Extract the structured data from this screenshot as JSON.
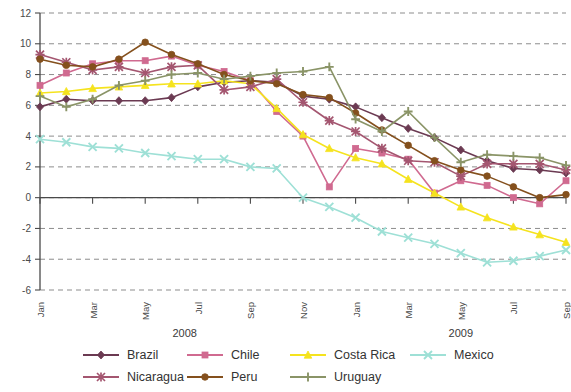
{
  "chart_data": {
    "type": "line",
    "title": "",
    "subtitle": "",
    "xlabel": "",
    "ylabel": "",
    "ylim": [
      -6,
      12
    ],
    "yticks": [
      -6,
      -4,
      -2,
      0,
      2,
      4,
      6,
      8,
      10,
      12
    ],
    "grid": true,
    "legend_position": "bottom",
    "x": [
      "Jan",
      "Feb",
      "Mar",
      "Apr",
      "May",
      "Jun",
      "Jul",
      "Aug",
      "Sep",
      "Oct",
      "Nov",
      "Dec",
      "Jan",
      "Feb",
      "Mar",
      "Apr",
      "May",
      "Jun",
      "Jul",
      "Aug",
      "Sep"
    ],
    "x_tick_labels": [
      "Jan",
      "Mar",
      "May",
      "Jul",
      "Sep",
      "Nov",
      "Jan",
      "Mar",
      "May",
      "Jul",
      "Sep"
    ],
    "x_tick_indices": [
      0,
      2,
      4,
      6,
      8,
      10,
      12,
      14,
      16,
      18,
      20
    ],
    "year_groups": [
      {
        "label": "2008",
        "start_index": 0,
        "end_index": 11
      },
      {
        "label": "2009",
        "start_index": 12,
        "end_index": 20
      }
    ],
    "series": [
      {
        "name": "Brazil",
        "color": "#6b3a52",
        "marker": "diamond",
        "values": [
          5.9,
          6.4,
          6.3,
          6.3,
          6.3,
          6.5,
          7.2,
          7.5,
          7.6,
          7.5,
          6.6,
          6.4,
          5.9,
          5.2,
          4.5,
          3.9,
          3.1,
          2.4,
          1.9,
          1.8,
          1.6
        ]
      },
      {
        "name": "Chile",
        "color": "#d06a90",
        "marker": "square",
        "values": [
          7.3,
          8.1,
          8.7,
          8.9,
          8.9,
          9.2,
          8.6,
          8.2,
          7.6,
          5.6,
          4.0,
          0.7,
          3.2,
          2.9,
          2.5,
          0.3,
          1.1,
          0.8,
          0.0,
          -0.4,
          1.1
        ]
      },
      {
        "name": "Costa Rica",
        "color": "#f5e31e",
        "marker": "triangle",
        "values": [
          6.8,
          6.9,
          7.1,
          7.2,
          7.3,
          7.4,
          7.4,
          7.6,
          7.4,
          5.8,
          4.1,
          3.2,
          2.6,
          2.2,
          1.2,
          0.3,
          -0.6,
          -1.3,
          -1.9,
          -2.4,
          -2.9
        ]
      },
      {
        "name": "Mexico",
        "color": "#9ee0d6",
        "marker": "cross",
        "values": [
          3.8,
          3.6,
          3.3,
          3.2,
          2.9,
          2.7,
          2.5,
          2.5,
          2.0,
          1.9,
          0.0,
          -0.6,
          -1.3,
          -2.2,
          -2.6,
          -3.0,
          -3.6,
          -4.2,
          -4.1,
          -3.8,
          -3.4
        ]
      },
      {
        "name": "Nicaragua",
        "color": "#a45670",
        "marker": "star",
        "values": [
          9.3,
          8.8,
          8.3,
          8.5,
          8.1,
          8.5,
          8.6,
          7.0,
          7.2,
          7.7,
          6.2,
          5.0,
          4.3,
          3.2,
          2.4,
          2.3,
          1.4,
          2.2,
          2.2,
          2.2,
          1.8
        ]
      },
      {
        "name": "Peru",
        "color": "#84501d",
        "marker": "circle",
        "values": [
          9.0,
          8.6,
          8.5,
          9.0,
          10.1,
          9.3,
          8.7,
          8.0,
          7.6,
          7.4,
          6.7,
          6.5,
          5.5,
          4.4,
          3.4,
          2.4,
          1.8,
          1.4,
          0.7,
          0.0,
          0.2
        ]
      },
      {
        "name": "Uruguay",
        "color": "#8a9467",
        "marker": "plus",
        "values": [
          6.6,
          5.9,
          6.4,
          7.3,
          7.6,
          8.0,
          8.1,
          7.7,
          7.9,
          8.1,
          8.2,
          8.5,
          5.1,
          4.3,
          5.6,
          3.9,
          2.3,
          2.8,
          2.7,
          2.6,
          2.1
        ]
      }
    ]
  },
  "legend": {
    "entries": [
      {
        "label": "Brazil",
        "color": "#6b3a52",
        "marker": "diamond"
      },
      {
        "label": "Chile",
        "color": "#d06a90",
        "marker": "square"
      },
      {
        "label": "Costa Rica",
        "color": "#f5e31e",
        "marker": "triangle"
      },
      {
        "label": "Mexico",
        "color": "#9ee0d6",
        "marker": "cross"
      },
      {
        "label": "Nicaragua",
        "color": "#a45670",
        "marker": "star"
      },
      {
        "label": "Peru",
        "color": "#84501d",
        "marker": "circle"
      },
      {
        "label": "Uruguay",
        "color": "#8a9467",
        "marker": "plus"
      }
    ]
  }
}
